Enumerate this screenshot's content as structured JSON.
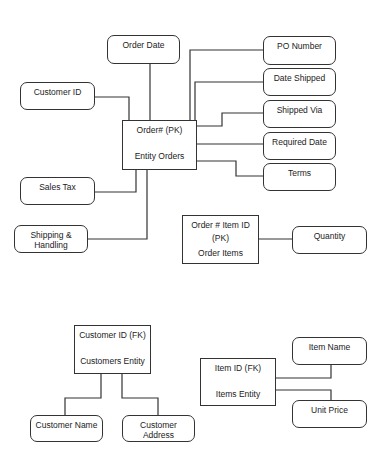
{
  "diagram": {
    "type": "entity-relationship",
    "entities": [
      {
        "id": "orders",
        "key_label": "Order# (PK)",
        "name": "Entity Orders",
        "attributes": [
          "Order Date",
          "Customer ID",
          "PO Number",
          "Date Shipped",
          "Shipped Via",
          "Required Date",
          "Terms",
          "Sales Tax",
          "Shipping & Handling"
        ]
      },
      {
        "id": "order-items",
        "key_label": "Order # Item ID (PK)",
        "name": "Order Items",
        "attributes": [
          "Quantity"
        ]
      },
      {
        "id": "customers",
        "key_label": "Customer ID (FK)",
        "name": "Customers Entity",
        "attributes": [
          "Customer Name",
          "Customer Address"
        ]
      },
      {
        "id": "items",
        "key_label": "Item ID (FK)",
        "name": "Items Entity",
        "attributes": [
          "Item Name",
          "Unit Price"
        ]
      }
    ]
  },
  "labels": {
    "orders_key": "Order# (PK)",
    "orders_name": "Entity Orders",
    "order_date": "Order Date",
    "customer_id": "Customer ID",
    "po_number": "PO Number",
    "date_shipped": "Date Shipped",
    "shipped_via": "Shipped Via",
    "required_date": "Required Date",
    "terms": "Terms",
    "sales_tax": "Sales Tax",
    "shipping_line1": "Shipping &",
    "shipping_line2": "Handling",
    "order_items_key1": "Order # Item ID",
    "order_items_key2": "(PK)",
    "order_items_name": "Order Items",
    "quantity": "Quantity",
    "customers_key": "Customer ID (FK)",
    "customers_name": "Customers Entity",
    "customer_name": "Customer Name",
    "customer_address_line1": "Customer",
    "customer_address_line2": "Address",
    "items_key": "Item ID (FK)",
    "items_name": "Items Entity",
    "item_name": "Item Name",
    "unit_price": "Unit Price"
  }
}
